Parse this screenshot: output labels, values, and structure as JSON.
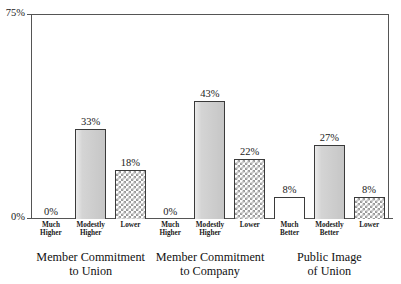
{
  "chart_data": {
    "type": "bar",
    "title": "",
    "subtitle": "",
    "xlabel": "",
    "ylabel": "",
    "ylim": [
      0,
      75
    ],
    "y_tick_labels": [
      "0%",
      "75%"
    ],
    "grid": false,
    "legend": "none",
    "axis_top_label": "75%",
    "axis_bottom_label": "0%",
    "groups": [
      {
        "caption_line1": "Member Commitment",
        "caption_line2": "to Union",
        "bars": [
          {
            "category_line1": "Much",
            "category_line2": "Higher",
            "value": 0,
            "label": "0%",
            "fill": "none"
          },
          {
            "category_line1": "Modestly",
            "category_line2": "Higher",
            "value": 33,
            "label": "33%",
            "fill": "gray"
          },
          {
            "category_line1": "Lower",
            "category_line2": "",
            "value": 18,
            "label": "18%",
            "fill": "checker"
          }
        ]
      },
      {
        "caption_line1": "Member Commitment",
        "caption_line2": "to Company",
        "bars": [
          {
            "category_line1": "Much",
            "category_line2": "Higher",
            "value": 0,
            "label": "0%",
            "fill": "none"
          },
          {
            "category_line1": "Modestly",
            "category_line2": "Higher",
            "value": 43,
            "label": "43%",
            "fill": "gray"
          },
          {
            "category_line1": "Lower",
            "category_line2": "",
            "value": 22,
            "label": "22%",
            "fill": "checker"
          }
        ]
      },
      {
        "caption_line1": "Public Image",
        "caption_line2": "of Union",
        "bars": [
          {
            "category_line1": "Much",
            "category_line2": "Better",
            "value": 8,
            "label": "8%",
            "fill": "white"
          },
          {
            "category_line1": "Modestly",
            "category_line2": "Better",
            "value": 27,
            "label": "27%",
            "fill": "gray"
          },
          {
            "category_line1": "Lower",
            "category_line2": "",
            "value": 8,
            "label": "8%",
            "fill": "checker"
          }
        ]
      }
    ],
    "colors": {
      "axis": "#555555",
      "bar_outline": "#3a3a3a",
      "bar_gray_fill": "#d2d2d2",
      "bar_white_fill": "#ffffff",
      "bar_checker_fill": "#9a9a9a",
      "text": "#1a1a1a",
      "background": "#ffffff"
    }
  }
}
